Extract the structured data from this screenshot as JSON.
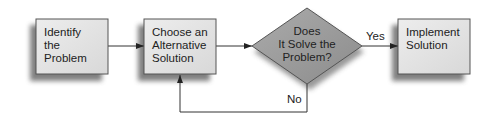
{
  "diagram": {
    "type": "flowchart",
    "nodes": [
      {
        "id": "identify",
        "shape": "rectangle",
        "lines": [
          "Identify",
          "the",
          "Problem"
        ]
      },
      {
        "id": "choose",
        "shape": "rectangle",
        "lines": [
          "Choose an",
          "Alternative",
          "Solution"
        ]
      },
      {
        "id": "decide",
        "shape": "diamond",
        "lines": [
          "Does",
          "It Solve the",
          "Problem?"
        ]
      },
      {
        "id": "implement",
        "shape": "rectangle",
        "lines": [
          "Implement",
          "Solution"
        ]
      }
    ],
    "edges": [
      {
        "from": "identify",
        "to": "choose",
        "label": ""
      },
      {
        "from": "choose",
        "to": "decide",
        "label": ""
      },
      {
        "from": "decide",
        "to": "implement",
        "label": "Yes"
      },
      {
        "from": "decide",
        "to": "choose",
        "label": "No"
      }
    ],
    "colors": {
      "box_fill": "#e4e4e4",
      "box_border": "#555555",
      "diamond_fill": "#9a9a9a",
      "shadow": "#6e6e6e",
      "line": "#333333"
    }
  }
}
